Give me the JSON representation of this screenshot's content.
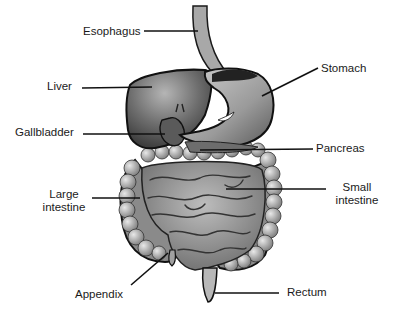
{
  "diagram": {
    "colors": {
      "background": "#ffffff",
      "text": "#1a1a1a",
      "leader_line": "#111111",
      "organ_dark": "#2a2a2a",
      "organ_mid": "#7a7a7a",
      "organ_light": "#c8c8c8"
    },
    "labels": {
      "esophagus": "Esophagus",
      "liver": "Liver",
      "gallbladder": "Gallbladder",
      "large_intestine_1": "Large",
      "large_intestine_2": "intestine",
      "appendix": "Appendix",
      "stomach": "Stomach",
      "pancreas": "Pancreas",
      "small_intestine_1": "Small",
      "small_intestine_2": "intestine",
      "rectum": "Rectum"
    }
  }
}
